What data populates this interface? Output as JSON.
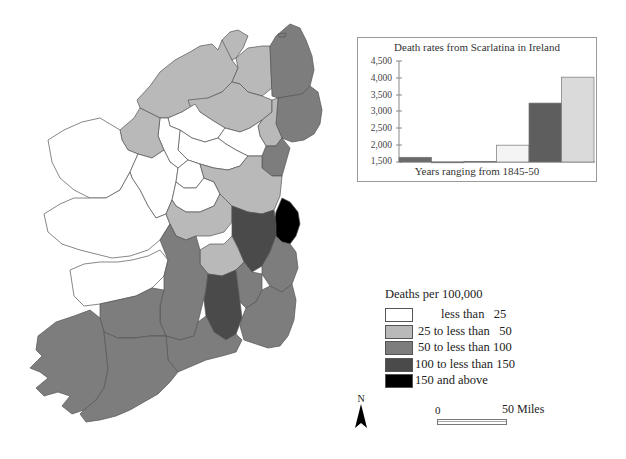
{
  "map": {
    "legend": {
      "title": "Deaths per 100,000",
      "classes": [
        {
          "label": "less than   25",
          "color": "#ffffff"
        },
        {
          "label": "25 to less than   50",
          "color": "#b9b9b9"
        },
        {
          "label": "50 to less than 100",
          "color": "#7d7d7d"
        },
        {
          "label": "100 to less than 150",
          "color": "#4a4a4a"
        },
        {
          "label": "150 and above",
          "color": "#000000"
        }
      ]
    },
    "north_label": "N",
    "scale": {
      "start_label": "0",
      "end_label": "50 Miles"
    }
  },
  "chart_data": {
    "type": "bar",
    "title": "Death rates from Scarlatina in Ireland",
    "xlabel": "Years ranging from 1845-50",
    "ylabel": "",
    "categories": [
      "1845",
      "1846",
      "1847",
      "1848",
      "1849",
      "1850"
    ],
    "values": [
      1640,
      1500,
      1520,
      2000,
      3250,
      4020
    ],
    "bar_colors": [
      "#6a6a6a",
      "#6a6a6a",
      "#7a7a7a",
      "#f4f4f4",
      "#5e5e5e",
      "#dadada"
    ],
    "yticks": [
      "4,500",
      "4,000",
      "3,500",
      "3,000",
      "2,500",
      "2,000",
      "1,500"
    ],
    "ylim": [
      1500,
      4500
    ],
    "grid": false,
    "legend": "none"
  }
}
